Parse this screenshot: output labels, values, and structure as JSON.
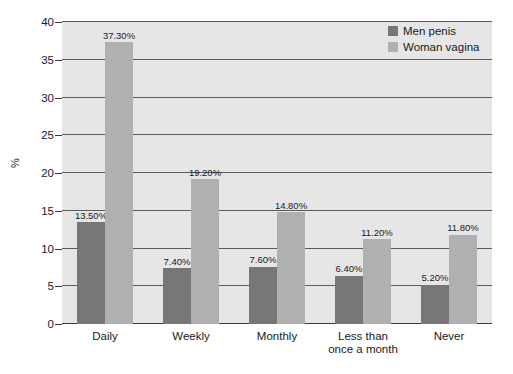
{
  "chart_data": {
    "type": "bar",
    "title": "",
    "xlabel": "",
    "ylabel": "%",
    "ylim": [
      0,
      40
    ],
    "yticks": [
      0,
      5,
      10,
      15,
      20,
      25,
      30,
      35,
      40
    ],
    "grid": true,
    "legend_position": "top-right",
    "categories": [
      "Daily",
      "Weekly",
      "Monthly",
      "Less than\nonce a month",
      "Never"
    ],
    "series": [
      {
        "name": "Men penis",
        "color": "#777777",
        "values": [
          13.5,
          7.4,
          7.6,
          6.4,
          5.2
        ],
        "labels": [
          "13.50%",
          "7.40%",
          "7.60%",
          "6.40%",
          "5.20%"
        ]
      },
      {
        "name": "Woman vagina",
        "color": "#b0b0b0",
        "values": [
          37.3,
          19.2,
          14.8,
          11.2,
          11.8
        ],
        "labels": [
          "37.30%",
          "19.20%",
          "14.80%",
          "11.20%",
          "11.80%"
        ]
      }
    ],
    "ytick_labels": [
      "0",
      "5",
      "10",
      "15",
      "20",
      "25",
      "30",
      "35",
      "40"
    ],
    "colors": {
      "plot_background": "#e6e6e6",
      "gridline": "#5a5a5a",
      "axis": "#3a3a3a",
      "text": "#1a1a1a",
      "page_background": "#ffffff"
    }
  },
  "legend": {
    "items": [
      {
        "label": "Men penis"
      },
      {
        "label": "Woman vagina"
      }
    ]
  }
}
